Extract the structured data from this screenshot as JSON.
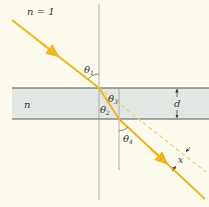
{
  "diagram": {
    "labels": {
      "outer_medium": "n = 1",
      "slab_index": "n",
      "theta1": "θ",
      "theta1_sub": "1",
      "theta2": "θ",
      "theta2_sub": "2",
      "theta3": "θ",
      "theta3_sub": "3",
      "theta4": "θ",
      "theta4_sub": "4",
      "thickness": "d",
      "displacement": "x"
    },
    "colors": {
      "background": "#fdfbee",
      "slab_fill": "#e3e7e3",
      "slab_edge": "#4a5a55",
      "ray": "#f0b41e",
      "dashed_ray": "#f3cf78",
      "normal": "#9a9a9a",
      "text": "#333333"
    }
  }
}
